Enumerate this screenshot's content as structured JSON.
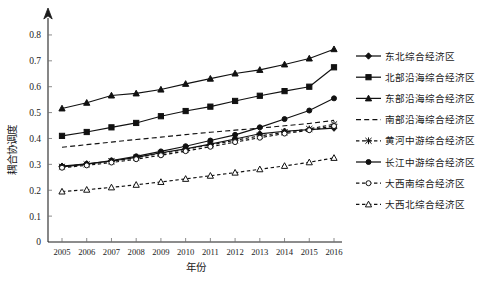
{
  "figure": {
    "top_partial_text": "",
    "y_axis_title": "耦合协调度",
    "x_axis_title": "年份"
  },
  "chart_data": {
    "type": "line",
    "title": "",
    "xlabel": "年份",
    "ylabel": "耦合协调度",
    "categories": [
      "2005",
      "2006",
      "2007",
      "2008",
      "2009",
      "2010",
      "2011",
      "2012",
      "2013",
      "2014",
      "2015",
      "2016"
    ],
    "x": [
      2005,
      2006,
      2007,
      2008,
      2009,
      2010,
      2011,
      2012,
      2013,
      2014,
      2015,
      2016
    ],
    "ylim": [
      0,
      0.85
    ],
    "yticks": [
      0,
      0.1,
      0.2,
      0.3,
      0.4,
      0.5,
      0.6,
      0.7,
      0.8
    ],
    "ytick_labels": [
      "0",
      "0.1",
      "0.2",
      "0.3",
      "0.4",
      "0.5",
      "0.6",
      "0.7",
      "0.8"
    ],
    "grid": false,
    "legend_position": "right",
    "series": [
      {
        "name": "东北综合经济区",
        "marker": "diamond",
        "marker_fill": "filled",
        "line_style": "solid",
        "values": [
          0.293,
          0.302,
          0.313,
          0.327,
          0.345,
          0.36,
          0.378,
          0.398,
          0.418,
          0.428,
          0.434,
          0.44
        ]
      },
      {
        "name": "北部沿海综合经济区",
        "marker": "square",
        "marker_fill": "filled",
        "line_style": "solid",
        "values": [
          0.41,
          0.425,
          0.443,
          0.46,
          0.486,
          0.506,
          0.523,
          0.545,
          0.565,
          0.583,
          0.6,
          0.675
        ]
      },
      {
        "name": "东部沿海综合经济区",
        "marker": "triangle",
        "marker_fill": "filled",
        "line_style": "solid",
        "values": [
          0.516,
          0.538,
          0.566,
          0.574,
          0.589,
          0.611,
          0.631,
          0.651,
          0.665,
          0.686,
          0.709,
          0.745
        ]
      },
      {
        "name": "南部沿海综合经济区",
        "marker": "none",
        "marker_fill": "none",
        "line_style": "dashed",
        "values": [
          0.366,
          0.376,
          0.386,
          0.396,
          0.405,
          0.415,
          0.424,
          0.432,
          0.44,
          0.449,
          0.458,
          0.47
        ]
      },
      {
        "name": "黄河中游综合经济区",
        "marker": "star",
        "marker_fill": "filled",
        "line_style": "dashed-tight",
        "values": [
          0.291,
          0.3,
          0.312,
          0.326,
          0.342,
          0.358,
          0.375,
          0.393,
          0.41,
          0.424,
          0.437,
          0.455
        ]
      },
      {
        "name": "长江中游综合经济区",
        "marker": "circle",
        "marker_fill": "filled",
        "line_style": "solid",
        "values": [
          0.29,
          0.301,
          0.315,
          0.331,
          0.35,
          0.37,
          0.392,
          0.414,
          0.443,
          0.475,
          0.508,
          0.555
        ]
      },
      {
        "name": "大西南综合经济区",
        "marker": "circle-open",
        "marker_fill": "open",
        "line_style": "dashed-tight",
        "values": [
          0.287,
          0.296,
          0.307,
          0.32,
          0.335,
          0.351,
          0.368,
          0.386,
          0.403,
          0.419,
          0.432,
          0.448
        ]
      },
      {
        "name": "大西北综合经济区",
        "marker": "triangle-open",
        "marker_fill": "open",
        "line_style": "dashed-tight",
        "values": [
          0.195,
          0.202,
          0.211,
          0.221,
          0.232,
          0.244,
          0.256,
          0.268,
          0.281,
          0.294,
          0.308,
          0.325
        ]
      }
    ]
  },
  "legend": {
    "items": [
      {
        "label": "东北综合经济区",
        "marker": "diamond",
        "line_style": "solid"
      },
      {
        "label": "北部沿海综合经济区",
        "marker": "square",
        "line_style": "solid"
      },
      {
        "label": "东部沿海综合经济区",
        "marker": "triangle",
        "line_style": "solid"
      },
      {
        "label": "南部沿海综合经济区",
        "marker": "none",
        "line_style": "dashed"
      },
      {
        "label": "黄河中游综合经济区",
        "marker": "star",
        "line_style": "dashed-tight"
      },
      {
        "label": "长江中游综合经济区",
        "marker": "circle",
        "line_style": "solid"
      },
      {
        "label": "大西南综合经济区",
        "marker": "circle-open",
        "line_style": "dashed-tight"
      },
      {
        "label": "大西北综合经济区",
        "marker": "triangle-open",
        "line_style": "dashed-tight"
      }
    ]
  },
  "colors": {
    "ink": "#111111",
    "axis": "#1a1a1a",
    "background": "#ffffff"
  }
}
